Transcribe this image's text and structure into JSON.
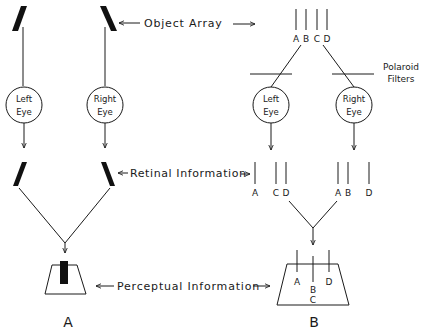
{
  "labels": {
    "object_array": "Object Array",
    "retinal_information": "Retinal Information",
    "perceptual_information": "Perceptual Information",
    "polaroid": "Polaroid",
    "filters": "Filters",
    "left_eye_line1": "Left",
    "left_eye_line2": "Eye",
    "right_eye_line1": "Right",
    "right_eye_line2": "Eye",
    "panel_a": "A",
    "panel_b": "B"
  },
  "panel_b": {
    "object_lines": [
      "A",
      "B",
      "C",
      "D"
    ],
    "left_retina": [
      "A",
      "C",
      "D"
    ],
    "right_retina": [
      "A",
      "B",
      "D"
    ],
    "percept": {
      "top": [
        "A",
        "D"
      ],
      "middle": "B",
      "bottom": "C"
    }
  },
  "colors": {
    "ink": "#1a1a1a",
    "background": "#ffffff"
  }
}
